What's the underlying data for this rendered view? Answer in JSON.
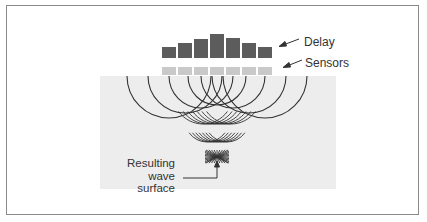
{
  "labels": {
    "delay": "Delay",
    "sensors": "Sensors",
    "result_lines": [
      "Resulting",
      "wave",
      "surface"
    ]
  },
  "colors": {
    "delay_bar": "#5c5c5c",
    "sensor": "#c9c9c9",
    "field": "#ededed",
    "line": "#333333",
    "frame": "#8a8a8a"
  },
  "diagram": {
    "sensor_count": 7,
    "delay_bar_heights": [
      11,
      15,
      19,
      24,
      20,
      15,
      11
    ],
    "arc_radii": [
      42,
      37,
      32,
      29,
      32,
      37,
      42
    ]
  }
}
